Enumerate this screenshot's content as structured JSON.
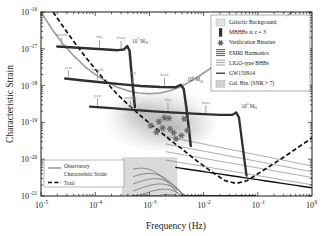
{
  "chart_data": {
    "type": "line",
    "title": "",
    "xlabel": "Frequency (Hz)",
    "ylabel": "Characteristic Strain",
    "xlim": [
      1e-05,
      1.0
    ],
    "ylim": [
      1e-21,
      1e-16
    ],
    "xscale": "log",
    "yscale": "log",
    "grid": false,
    "xticks": [
      {
        "exp": "-5",
        "base": "10"
      },
      {
        "exp": "-4",
        "base": "10"
      },
      {
        "exp": "-3",
        "base": "10"
      },
      {
        "exp": "-2",
        "base": "10"
      },
      {
        "exp": "-1",
        "base": "10"
      },
      {
        "exp": "0",
        "base": "10"
      }
    ],
    "yticks": [
      {
        "exp": "-16",
        "base": "10"
      },
      {
        "exp": "-17",
        "base": "10"
      },
      {
        "exp": "-18",
        "base": "10"
      },
      {
        "exp": "-19",
        "base": "10"
      },
      {
        "exp": "-20",
        "base": "10"
      },
      {
        "exp": "-21",
        "base": "10"
      }
    ],
    "series": [
      {
        "name": "Observatory Characteristic Strain",
        "style": "solid-grey",
        "points": [
          [
            1e-05,
            1e-16
          ],
          [
            1.6e-05,
            3.4e-17
          ],
          [
            2.5e-05,
            1.4e-17
          ],
          [
            4e-05,
            6.5e-18
          ],
          [
            6.3e-05,
            3.4e-18
          ],
          [
            0.0001,
            2e-18
          ],
          [
            0.00016,
            1.3e-18
          ],
          [
            0.00025,
            9.2e-19
          ],
          [
            0.0004,
            7.2e-19
          ],
          [
            0.00063,
            6.3e-19
          ],
          [
            0.001,
            6e-19
          ],
          [
            0.0016,
            6.3e-19
          ],
          [
            0.0025,
            7.4e-19
          ],
          [
            0.004,
            9.8e-19
          ],
          [
            0.0063,
            1.4e-18
          ],
          [
            0.01,
            2.2e-18
          ],
          [
            0.016,
            3.5e-18
          ],
          [
            0.025,
            5.5e-18
          ],
          [
            0.04,
            8.8e-18
          ],
          [
            0.063,
            1.4e-17
          ],
          [
            0.1,
            2.2e-17
          ],
          [
            0.16,
            3.6e-17
          ],
          [
            0.25,
            5.6e-17
          ],
          [
            0.4,
            9e-17
          ],
          [
            0.63,
            1.4e-16
          ],
          [
            1.0,
            2.3e-16
          ]
        ]
      },
      {
        "name": "Total",
        "style": "dashed-black",
        "points": [
          [
            1e-05,
            3e-16
          ],
          [
            1.6e-05,
            1.1e-16
          ],
          [
            2.5e-05,
            4.2e-17
          ],
          [
            4e-05,
            1.6e-17
          ],
          [
            6.3e-05,
            6.6e-18
          ],
          [
            0.0001,
            2.8e-18
          ],
          [
            0.00016,
            1.25e-18
          ],
          [
            0.00025,
            6e-19
          ],
          [
            0.0004,
            3.1e-19
          ],
          [
            0.00063,
            1.7e-19
          ],
          [
            0.001,
            9.5e-20
          ],
          [
            0.0016,
            5.5e-20
          ],
          [
            0.0025,
            3.2e-20
          ],
          [
            0.004,
            1.9e-20
          ],
          [
            0.0063,
            1.1e-20
          ],
          [
            0.01,
            6.6e-21
          ],
          [
            0.016,
            4e-21
          ],
          [
            0.025,
            2.6e-21
          ],
          [
            0.04,
            2.2e-21
          ],
          [
            0.063,
            2.6e-21
          ],
          [
            0.1,
            4e-21
          ],
          [
            0.16,
            6.2e-21
          ],
          [
            0.25,
            9.5e-21
          ],
          [
            0.4,
            1.5e-20
          ],
          [
            0.63,
            2.4e-20
          ],
          [
            1.0,
            3.8e-20
          ]
        ]
      }
    ],
    "mbhb_tracks": [
      {
        "label_base": "10",
        "label_exp": "7",
        "label_suffix": "M",
        "label_sub": "⊙",
        "mass": "1e7",
        "time_markers": [
          "month",
          "day",
          "hour"
        ],
        "points": [
          [
            2e-05,
            1.15e-17
          ],
          [
            4e-05,
            1.08e-17
          ],
          [
            8e-05,
            1.02e-17
          ],
          [
            0.00016,
            9.6e-18
          ],
          [
            0.00026,
            9.2e-18
          ],
          [
            0.00034,
            9.6e-18
          ],
          [
            0.00039,
            1.18e-17
          ],
          [
            0.00043,
            9e-18
          ],
          [
            0.00046,
            3e-18
          ],
          [
            0.0005,
            8e-19
          ],
          [
            0.00054,
            2.6e-19
          ]
        ]
      },
      {
        "label_base": "10",
        "label_exp": "6",
        "label_suffix": "M",
        "label_sub": "⊙",
        "mass": "1e6",
        "time_markers": [
          "year",
          "month",
          "day",
          "hour"
        ],
        "points": [
          [
            2.8e-05,
            1.55e-18
          ],
          [
            6e-05,
            1.38e-18
          ],
          [
            0.00014,
            1.22e-18
          ],
          [
            0.00032,
            1.08e-18
          ],
          [
            0.0007,
            9.8e-19
          ],
          [
            0.0016,
            9.2e-19
          ],
          [
            0.003,
            9e-19
          ],
          [
            0.0038,
            1.05e-18
          ],
          [
            0.0043,
            8e-19
          ],
          [
            0.0048,
            2.6e-19
          ],
          [
            0.0053,
            7.5e-20
          ],
          [
            0.0058,
            2.3e-20
          ]
        ]
      },
      {
        "label_base": "10",
        "label_exp": "5",
        "label_suffix": "M",
        "label_sub": "⊙",
        "mass": "1e5",
        "time_markers": [
          "year",
          "month",
          "day",
          "hour"
        ],
        "points": [
          [
            8e-05,
            2.7e-19
          ],
          [
            0.0002,
            2.45e-19
          ],
          [
            0.0005,
            2.2e-19
          ],
          [
            0.0012,
            2e-19
          ],
          [
            0.003,
            1.85e-19
          ],
          [
            0.008,
            1.7e-19
          ],
          [
            0.02,
            1.6e-19
          ],
          [
            0.034,
            1.6e-19
          ],
          [
            0.04,
            1.85e-19
          ],
          [
            0.045,
            1.35e-19
          ],
          [
            0.05,
            4e-20
          ],
          [
            0.056,
            1.1e-20
          ],
          [
            0.062,
            3.6e-21
          ]
        ]
      }
    ],
    "verification_binaries": [
      [
        0.00105,
        8.2e-20
      ],
      [
        0.00135,
        5.4e-20
      ],
      [
        0.0015,
        1.05e-19
      ],
      [
        0.00175,
        7e-20
      ],
      [
        0.0019,
        1.35e-19
      ],
      [
        0.0023,
        1.3e-19
      ],
      [
        0.0024,
        6.6e-20
      ],
      [
        0.0028,
        5.2e-20
      ],
      [
        0.0031,
        3.6e-20
      ],
      [
        0.0039,
        4.4e-20
      ],
      [
        0.0044,
        1.25e-19
      ],
      [
        0.005,
        6e-20
      ]
    ],
    "galactic_box": {
      "x0": 0.00032,
      "x1": 0.0032,
      "y0": 1e-21,
      "y1": 1.1e-20
    },
    "annotations": []
  },
  "legend_main": {
    "items": [
      {
        "label": "Galactic Background",
        "marker": "patch-grey"
      },
      {
        "label": "MBHBs at z = 3",
        "marker": "bar-black"
      },
      {
        "label": "Verification Binaries",
        "marker": "star"
      },
      {
        "label": "EMRI Harmonics",
        "marker": "lines-stack"
      },
      {
        "label": "LIGO-type BHBs",
        "marker": "lines-thin"
      },
      {
        "label": "GW150914",
        "marker": "line-single"
      },
      {
        "label": "Gal. Bin. (SNR > 7)",
        "marker": "patch-dots"
      }
    ]
  },
  "legend_inset": {
    "items": [
      {
        "label_line1": "Observatory",
        "label_line2": "Characteristic Strain",
        "marker": "solid-grey"
      },
      {
        "label_line1": "Total",
        "label_line2": "",
        "marker": "dashed-black"
      }
    ]
  }
}
